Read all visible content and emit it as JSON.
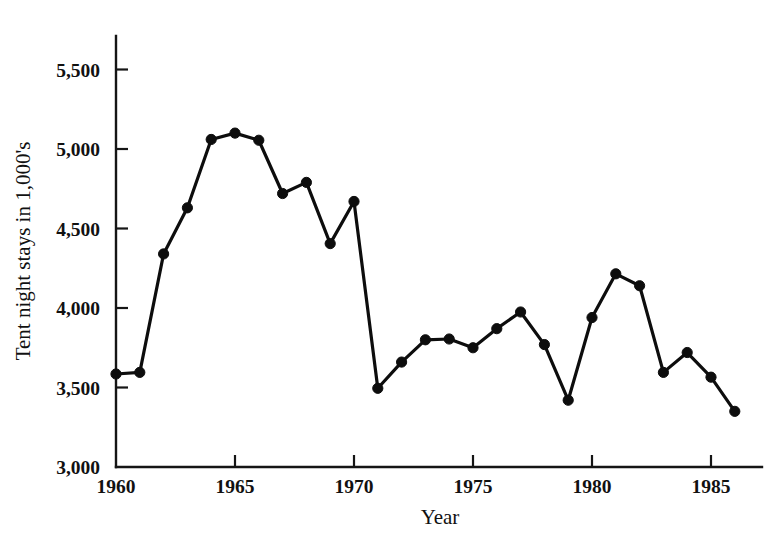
{
  "chart_data": {
    "type": "line",
    "title": "",
    "xlabel": "Year",
    "ylabel": "Tent night stays in 1,000's",
    "x": [
      1960,
      1961,
      1962,
      1963,
      1964,
      1965,
      1966,
      1967,
      1968,
      1969,
      1970,
      1971,
      1972,
      1973,
      1974,
      1975,
      1976,
      1977,
      1978,
      1979,
      1980,
      1981,
      1982,
      1983,
      1984,
      1985,
      1986
    ],
    "values": [
      3585,
      3595,
      4340,
      4630,
      5060,
      5100,
      5055,
      4720,
      4790,
      4405,
      4670,
      3495,
      3660,
      3800,
      3805,
      3750,
      3870,
      3975,
      3770,
      3420,
      3940,
      4215,
      4140,
      3595,
      3720,
      3565,
      3350
    ],
    "series": [
      {
        "name": "Tent night stays",
        "values": [
          3585,
          3595,
          4340,
          4630,
          5060,
          5100,
          5055,
          4720,
          4790,
          4405,
          4670,
          3495,
          3660,
          3800,
          3805,
          3750,
          3870,
          3975,
          3770,
          3420,
          3940,
          4215,
          4140,
          3595,
          3720,
          3565,
          3350
        ]
      }
    ],
    "xlim": [
      1960,
      1987
    ],
    "ylim": [
      3000,
      5700
    ],
    "xticks": [
      1960,
      1965,
      1970,
      1975,
      1980,
      1985
    ],
    "xtick_labels": [
      "1960",
      "1965",
      "1970",
      "1975",
      "1980",
      "1985"
    ],
    "yticks": [
      3000,
      3500,
      4000,
      4500,
      5000,
      5500
    ],
    "ytick_labels": [
      "3,000",
      "3,500",
      "4,000",
      "4,500",
      "5,000",
      "5,500"
    ],
    "grid": false,
    "legend": false,
    "marker": "filled-circle",
    "line_color": "#0d0d0d",
    "marker_color": "#0d0d0d",
    "background_color": "#ffffff"
  }
}
